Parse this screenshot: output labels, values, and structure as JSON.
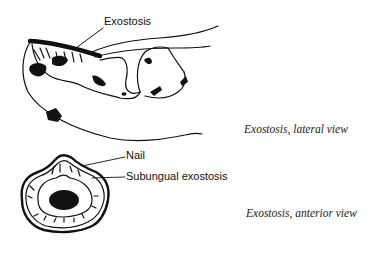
{
  "figure": {
    "lateral": {
      "label": "Exostosis",
      "caption": "Exostosis, lateral view"
    },
    "anterior": {
      "labels": {
        "nail": "Nail",
        "subungual": "Subungual exostosis"
      },
      "caption": "Exostosis, anterior view"
    },
    "colors": {
      "ink": "#111111",
      "background": "#ffffff"
    }
  }
}
